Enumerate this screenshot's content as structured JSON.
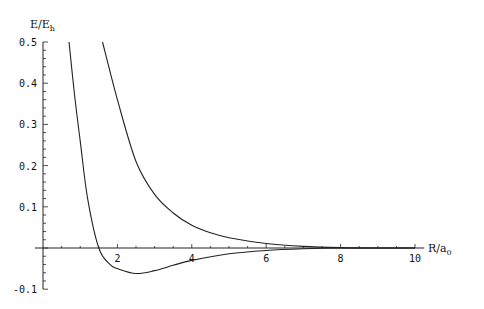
{
  "chart_data": {
    "type": "line",
    "title": "",
    "xlabel": "R/a0",
    "ylabel": "E/Eh",
    "xlim": [
      0,
      10
    ],
    "ylim": [
      -0.1,
      0.5
    ],
    "x_ticks": [
      2,
      4,
      6,
      8,
      10
    ],
    "x_tick_labels": [
      "2",
      "4",
      "6",
      "8",
      "10"
    ],
    "y_ticks": [
      -0.1,
      0.1,
      0.2,
      0.3,
      0.4,
      0.5
    ],
    "y_tick_labels": [
      "-0.1",
      "0.1",
      "0.2",
      "0.3",
      "0.4",
      "0.5"
    ],
    "grid": false,
    "legend": null,
    "series": [
      {
        "name": "repulsive curve",
        "x": [
          1.6,
          2.0,
          2.5,
          3.0,
          3.5,
          4.0,
          4.5,
          5.0,
          6.0,
          7.0,
          8.0,
          9.0,
          10.0
        ],
        "y": [
          0.5,
          0.36,
          0.21,
          0.13,
          0.085,
          0.055,
          0.037,
          0.025,
          0.011,
          0.004,
          0.001,
          0.0,
          0.0
        ]
      },
      {
        "name": "bound curve",
        "x": [
          0.7,
          0.85,
          1.0,
          1.2,
          1.5,
          1.8,
          2.0,
          2.5,
          3.0,
          3.5,
          4.0,
          5.0,
          6.0,
          7.0,
          8.0,
          9.0,
          10.0
        ],
        "y": [
          0.5,
          0.37,
          0.26,
          0.12,
          0.0,
          -0.04,
          -0.05,
          -0.062,
          -0.055,
          -0.042,
          -0.03,
          -0.014,
          -0.006,
          -0.002,
          0.0,
          0.0,
          0.0
        ]
      }
    ]
  },
  "labels": {
    "y_axis": "E/E",
    "y_axis_sub": "h",
    "x_axis": "R/a",
    "x_axis_sub": "0"
  }
}
